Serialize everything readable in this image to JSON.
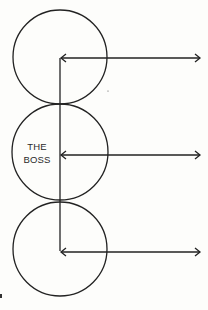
{
  "diagram": {
    "boss_label_line1": "THE",
    "boss_label_line2": "BOSS",
    "stroke_color": "#222222",
    "background_color": "#fdfdfb",
    "nodes": [
      {
        "name": "top-circle",
        "label": ""
      },
      {
        "name": "boss-circle",
        "label": "THE BOSS"
      },
      {
        "name": "bottom-circle",
        "label": ""
      }
    ],
    "arrows": [
      {
        "name": "top-arrow",
        "direction": "bidirectional"
      },
      {
        "name": "middle-arrow",
        "direction": "bidirectional"
      },
      {
        "name": "bottom-arrow",
        "direction": "bidirectional"
      }
    ]
  }
}
